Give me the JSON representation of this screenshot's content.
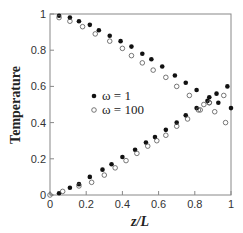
{
  "chart_data": {
    "type": "scatter",
    "title": "",
    "xlabel": "z/L",
    "ylabel": "Temperature",
    "xlim": [
      0,
      1
    ],
    "ylim": [
      0,
      1
    ],
    "grid": false,
    "legend_position": "center-left (inside plot)",
    "x_ticks": [
      "0",
      "0.2",
      "0.4",
      "0.6",
      "0.8",
      "1"
    ],
    "y_ticks": [
      "0",
      "0.2",
      "0.4",
      "0.6",
      "0.8",
      "1"
    ],
    "series": [
      {
        "name": "ω = 1",
        "marker": "filled-circle",
        "branch": "descending",
        "x": [
          0.05,
          0.11,
          0.16,
          0.22,
          0.27,
          0.33,
          0.39,
          0.45,
          0.51,
          0.56,
          0.62,
          0.69,
          0.75,
          0.81,
          0.88,
          0.93,
          1.0
        ],
        "y": [
          0.99,
          0.98,
          0.96,
          0.94,
          0.91,
          0.88,
          0.85,
          0.82,
          0.78,
          0.75,
          0.71,
          0.66,
          0.62,
          0.58,
          0.54,
          0.51,
          0.48
        ]
      },
      {
        "name": "ω = 100",
        "marker": "open-circle",
        "branch": "descending",
        "x": [
          0.05,
          0.11,
          0.18,
          0.25,
          0.33,
          0.4,
          0.45,
          0.51,
          0.57,
          0.64,
          0.7,
          0.77,
          0.83,
          0.88,
          0.91,
          0.97
        ],
        "y": [
          0.98,
          0.96,
          0.93,
          0.89,
          0.85,
          0.81,
          0.77,
          0.73,
          0.69,
          0.65,
          0.6,
          0.55,
          0.47,
          0.51,
          0.46,
          0.4
        ]
      },
      {
        "name": "ω = 1",
        "marker": "filled-circle",
        "branch": "ascending",
        "x": [
          0.05,
          0.11,
          0.16,
          0.22,
          0.29,
          0.34,
          0.4,
          0.47,
          0.53,
          0.58,
          0.64,
          0.7,
          0.75,
          0.81,
          0.87,
          0.92,
          0.98
        ],
        "y": [
          0.01,
          0.04,
          0.06,
          0.1,
          0.14,
          0.17,
          0.21,
          0.25,
          0.29,
          0.32,
          0.36,
          0.4,
          0.44,
          0.48,
          0.52,
          0.56,
          0.6
        ]
      },
      {
        "name": "ω = 100",
        "marker": "open-circle",
        "branch": "ascending",
        "x": [
          0.0,
          0.07,
          0.16,
          0.23,
          0.3,
          0.36,
          0.42,
          0.48,
          0.54,
          0.59,
          0.64,
          0.7,
          0.76,
          0.82,
          0.85,
          0.88,
          0.96
        ],
        "y": [
          0.0,
          0.02,
          0.05,
          0.07,
          0.11,
          0.15,
          0.19,
          0.23,
          0.27,
          0.3,
          0.33,
          0.38,
          0.42,
          0.47,
          0.5,
          0.51,
          0.55
        ]
      }
    ],
    "legend": [
      {
        "label": "ω = 1",
        "marker": "filled-circle"
      },
      {
        "label": "ω = 100",
        "marker": "open-circle"
      }
    ]
  },
  "axes": {
    "x_title": "z/L",
    "y_title": "Temperature"
  },
  "legend": {
    "item1": "ω = 1",
    "item2": "ω = 100"
  },
  "colors": {
    "marker": "#111111",
    "axis": "#777777",
    "text": "#222222"
  }
}
